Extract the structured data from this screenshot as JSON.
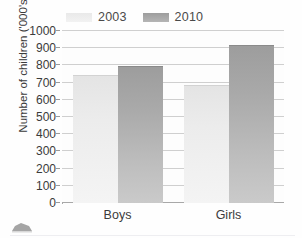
{
  "chart_data": {
    "type": "bar",
    "title": "",
    "subtitle": "",
    "xlabel": "",
    "ylabel": "Number of children ('000's)",
    "categories": [
      "Boys",
      "Girls"
    ],
    "series": [
      {
        "name": "2003",
        "values": [
          740,
          680
        ],
        "color": "#ececec"
      },
      {
        "name": "2010",
        "values": [
          790,
          910
        ],
        "color": "#a9a9a9"
      }
    ],
    "ylim": [
      0,
      1000
    ],
    "ytick_step": 100,
    "ytick_labels": [
      "1000",
      "900",
      "800",
      "700",
      "600",
      "500",
      "400",
      "300",
      "200",
      "100",
      "0"
    ],
    "grid": true,
    "grid_axis": "y",
    "legend_position": "top",
    "annotations": []
  },
  "legend": {
    "entries": [
      {
        "label": "2003",
        "swatch_color": "#ececec"
      },
      {
        "label": "2010",
        "swatch_color": "#a9a9a9"
      }
    ]
  },
  "axes": {
    "y_title": "Number of children ('000's)",
    "y_ticks": [
      "1000",
      "900",
      "800",
      "700",
      "600",
      "500",
      "400",
      "300",
      "200",
      "100",
      "0"
    ],
    "x_ticks": [
      "Boys",
      "Girls"
    ]
  },
  "style": {
    "background": "#fefefe",
    "gridline_color": "#cfcfcf",
    "axis_color": "#a8a8a8",
    "text_color": "#3b3b3b"
  },
  "artifacts": {
    "corner_icon_name": "scan-artifact-icon"
  }
}
